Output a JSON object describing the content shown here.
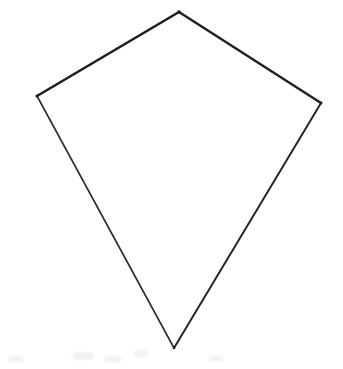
{
  "canvas": {
    "width": 343,
    "height": 369,
    "background_color": "#ffffff",
    "title": "Hand-drawn kite quadrilateral"
  },
  "figure": {
    "name": "kite-quadrilateral",
    "type": "polygon",
    "sides": 4,
    "closed": true,
    "fill_color": "#ffffff",
    "stroke_color": "#1f1f1f",
    "label": "Kite",
    "vertices": [
      {
        "id": "apex-top",
        "label": "Top vertex",
        "x": 179,
        "y": 12
      },
      {
        "id": "vertex-right",
        "label": "Right vertex",
        "x": 321,
        "y": 103
      },
      {
        "id": "apex-bottom",
        "label": "Bottom vertex",
        "x": 174,
        "y": 348
      },
      {
        "id": "vertex-left",
        "label": "Left vertex",
        "x": 37,
        "y": 96
      }
    ],
    "edges": [
      {
        "id": "edge-top-left",
        "label": "Top-left edge",
        "from": "vertex-left",
        "to": "apex-top",
        "x1": 37,
        "y1": 96,
        "x2": 179,
        "y2": 12,
        "stroke_width": 2.6,
        "stroke_color": "#1e1e1e"
      },
      {
        "id": "edge-top-right",
        "label": "Top-right edge",
        "from": "apex-top",
        "to": "vertex-right",
        "x1": 179,
        "y1": 12,
        "x2": 321,
        "y2": 103,
        "stroke_width": 2.5,
        "stroke_color": "#212121"
      },
      {
        "id": "edge-bottom-right",
        "label": "Bottom-right edge",
        "from": "vertex-right",
        "to": "apex-bottom",
        "x1": 321,
        "y1": 103,
        "x2": 174,
        "y2": 348,
        "stroke_width": 2.0,
        "stroke_color": "#242424"
      },
      {
        "id": "edge-bottom-left",
        "label": "Bottom-left edge",
        "from": "apex-bottom",
        "to": "vertex-left",
        "x1": 174,
        "y1": 348,
        "x2": 37,
        "y2": 96,
        "stroke_width": 1.6,
        "stroke_color": "#2b2b2b"
      }
    ],
    "artifacts": [
      {
        "id": "smudge-1",
        "x": 8,
        "y": 356,
        "width": 16,
        "height": 7,
        "color": "#f2f2f2"
      },
      {
        "id": "smudge-2",
        "x": 72,
        "y": 352,
        "width": 22,
        "height": 8,
        "color": "#f1f1f1"
      },
      {
        "id": "smudge-3",
        "x": 104,
        "y": 356,
        "width": 18,
        "height": 7,
        "color": "#f3f3f3"
      },
      {
        "id": "smudge-4",
        "x": 134,
        "y": 350,
        "width": 14,
        "height": 8,
        "color": "#f2f2f2"
      },
      {
        "id": "smudge-5",
        "x": 208,
        "y": 356,
        "width": 16,
        "height": 6,
        "color": "#f3f3f3"
      }
    ]
  }
}
